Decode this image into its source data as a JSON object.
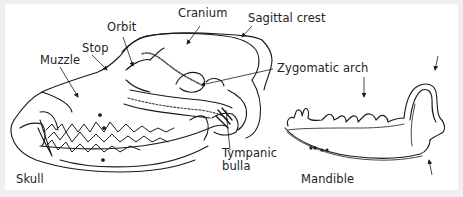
{
  "figure": {
    "type": "anatomical line drawing",
    "background_color": "#efefef",
    "panel_color": "#ffffff",
    "line_color": "#1a1a1a"
  },
  "skull": {
    "caption": "Skull",
    "labels": {
      "cranium": "Cranium",
      "sagittal_crest": "Sagittal crest",
      "orbit": "Orbit",
      "stop": "Stop",
      "muzzle": "Muzzle",
      "zygomatic_arch": "Zygomatic arch",
      "tympanic_bulla_line1": "Tympanic",
      "tympanic_bulla_line2": "bulla"
    }
  },
  "mandible": {
    "caption": "Mandible",
    "unlabeled_arrows": 3
  }
}
